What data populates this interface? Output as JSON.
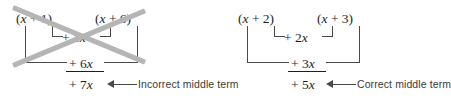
{
  "figure": {
    "type": "math-illustration",
    "background_color": "#ffffff",
    "ink_color": "#1e1e1e",
    "bracket_color": "#4a4a4a",
    "crossout_color": "#b5b5b5",
    "annotation_color": "#3a3a3a"
  },
  "panels": [
    {
      "id": "incorrect",
      "factor_left": "(x + 1)",
      "factor_right": "(x + 6)",
      "inner_product": "+ 1x",
      "outer_product": "+ 6x",
      "middle_term": "+ 7x",
      "annotation": "Incorrect middle term",
      "crossed_out": true,
      "icon": "x-crossout-icon"
    },
    {
      "id": "correct",
      "factor_left": "(x + 2)",
      "factor_right": "(x + 3)",
      "inner_product": "+ 2x",
      "outer_product": "+ 3x",
      "middle_term": "+ 5x",
      "annotation": "Correct middle term",
      "crossed_out": false,
      "icon": "arrow-left-icon"
    }
  ]
}
